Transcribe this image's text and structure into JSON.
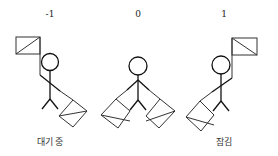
{
  "figures": [
    {
      "value": "-1",
      "label": "대기 중",
      "x": 50
    },
    {
      "value": "0",
      "label": "",
      "x": 138
    },
    {
      "value": "1",
      "label": "잠김",
      "x": 224
    }
  ],
  "colors": {
    "line": "#111111",
    "flag": "#333333",
    "background": "#ffffff"
  }
}
